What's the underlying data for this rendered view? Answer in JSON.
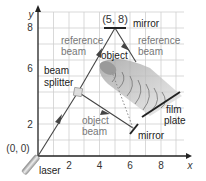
{
  "axes": {
    "x_label": "x",
    "y_label": "y",
    "x_ticks": [
      "2",
      "4",
      "6",
      "8"
    ],
    "y_ticks": [
      "2",
      "4",
      "6",
      "8"
    ],
    "origin_label": "(0, 0)"
  },
  "points": {
    "top_mirror_point": "(5, 8)"
  },
  "labels": {
    "mirror_top": "mirror",
    "reference_beam_left_1": "reference",
    "reference_beam_left_2": "beam",
    "reference_beam_right_1": "reference",
    "reference_beam_right_2": "beam",
    "object": "object",
    "beam_splitter_1": "beam",
    "beam_splitter_2": "splitter",
    "object_beam_1": "object",
    "object_beam_2": "beam",
    "mirror_bottom": "mirror",
    "film_plate_1": "film",
    "film_plate_2": "plate",
    "laser": "laser"
  },
  "colors": {
    "grid": "#c9c9c9",
    "axis": "#222222",
    "beam": "#444444",
    "label_dark": "#222222",
    "label_gray": "#777777",
    "splitter": "#d8d8d8"
  }
}
